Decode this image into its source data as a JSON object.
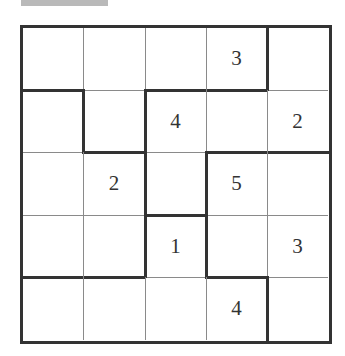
{
  "puzzle": {
    "type": "region-number-grid",
    "rows": 5,
    "cols": 5,
    "givens": [
      [
        "",
        "",
        "",
        "3",
        ""
      ],
      [
        "",
        "",
        "4",
        "",
        "2"
      ],
      [
        "",
        "2",
        "",
        "5",
        ""
      ],
      [
        "",
        "",
        "1",
        "",
        "3"
      ],
      [
        "",
        "",
        "",
        "4",
        ""
      ]
    ],
    "thick_horizontal": [
      [
        true,
        false,
        true,
        true,
        false
      ],
      [
        false,
        true,
        false,
        true,
        true
      ],
      [
        false,
        false,
        true,
        false,
        false
      ],
      [
        true,
        true,
        false,
        true,
        false
      ]
    ],
    "thick_vertical": [
      [
        false,
        false,
        false,
        true
      ],
      [
        true,
        true,
        false,
        false
      ],
      [
        false,
        true,
        true,
        false
      ],
      [
        false,
        true,
        true,
        false
      ],
      [
        false,
        false,
        false,
        true
      ]
    ]
  },
  "colors": {
    "line_thin": "#8a8a8a",
    "line_thick": "#333333",
    "digit": "#333333",
    "background": "#ffffff"
  }
}
